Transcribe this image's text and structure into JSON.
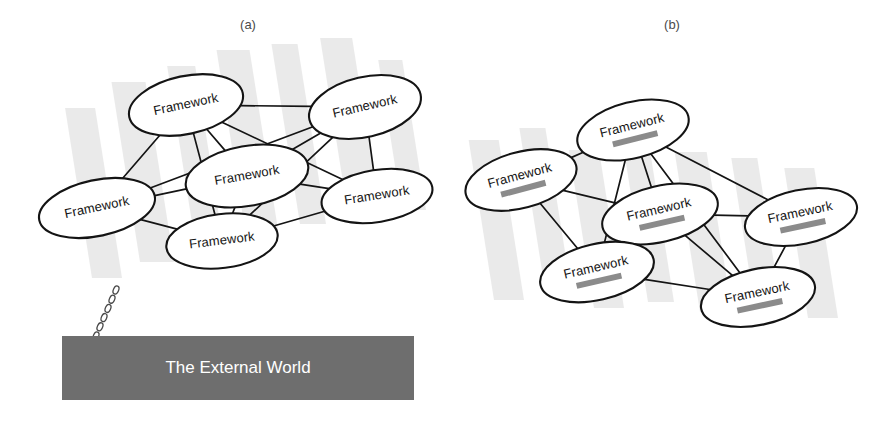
{
  "figure": {
    "width": 890,
    "height": 421,
    "background": "#ffffff",
    "panels": [
      {
        "id": "panel-a",
        "caption": "(a)",
        "caption_x": 248,
        "caption_y": 26,
        "nodes": [
          {
            "id": "a1",
            "label": "Framework",
            "cx": 186,
            "cy": 105,
            "rx": 58,
            "ry": 29,
            "rot": -12,
            "redacted": false
          },
          {
            "id": "a2",
            "label": "Framework",
            "cx": 365,
            "cy": 107,
            "rx": 57,
            "ry": 30,
            "rot": -13,
            "redacted": false
          },
          {
            "id": "a3",
            "label": "Framework",
            "cx": 247,
            "cy": 176,
            "rx": 62,
            "ry": 30,
            "rot": -10,
            "redacted": false
          },
          {
            "id": "a4",
            "label": "Framework",
            "cx": 97,
            "cy": 208,
            "rx": 59,
            "ry": 28,
            "rot": -12,
            "redacted": false
          },
          {
            "id": "a5",
            "label": "Framework",
            "cx": 377,
            "cy": 196,
            "rx": 56,
            "ry": 26,
            "rot": -9,
            "redacted": false
          },
          {
            "id": "a6",
            "label": "Framework",
            "cx": 222,
            "cy": 241,
            "rx": 56,
            "ry": 27,
            "rot": -7,
            "redacted": false
          }
        ],
        "edges": [
          [
            "a1",
            "a2"
          ],
          [
            "a1",
            "a3"
          ],
          [
            "a1",
            "a4"
          ],
          [
            "a1",
            "a5"
          ],
          [
            "a1",
            "a6"
          ],
          [
            "a2",
            "a3"
          ],
          [
            "a2",
            "a4"
          ],
          [
            "a2",
            "a5"
          ],
          [
            "a2",
            "a6"
          ],
          [
            "a3",
            "a4"
          ],
          [
            "a3",
            "a5"
          ],
          [
            "a3",
            "a6"
          ],
          [
            "a4",
            "a6"
          ],
          [
            "a5",
            "a6"
          ]
        ],
        "bands": [
          {
            "x": 92,
            "y": 108,
            "w": 30,
            "h": 170,
            "skew": -9
          },
          {
            "x": 140,
            "y": 82,
            "w": 34,
            "h": 180,
            "skew": -9
          },
          {
            "x": 196,
            "y": 66,
            "w": 28,
            "h": 182,
            "skew": -9
          },
          {
            "x": 246,
            "y": 50,
            "w": 33,
            "h": 186,
            "skew": -9
          },
          {
            "x": 300,
            "y": 44,
            "w": 26,
            "h": 180,
            "skew": -9
          },
          {
            "x": 348,
            "y": 38,
            "w": 32,
            "h": 176,
            "skew": -9
          },
          {
            "x": 402,
            "y": 60,
            "w": 24,
            "h": 150,
            "skew": -9
          }
        ],
        "external_world": {
          "label": "The External World",
          "x": 62,
          "y": 336,
          "w": 352,
          "h": 64,
          "color": "#6e6e6e",
          "text_color": "#ffffff"
        },
        "chain": {
          "from_x": 116,
          "from_y": 290,
          "to_x": 96,
          "to_y": 336,
          "links": 6
        }
      },
      {
        "id": "panel-b",
        "caption": "(b)",
        "caption_x": 672,
        "caption_y": 26,
        "nodes": [
          {
            "id": "b1",
            "label": "Framework",
            "cx": 633,
            "cy": 130,
            "rx": 57,
            "ry": 28,
            "rot": -14,
            "redacted": true
          },
          {
            "id": "b2",
            "label": "Framework",
            "cx": 521,
            "cy": 180,
            "rx": 57,
            "ry": 28,
            "rot": -15,
            "redacted": true
          },
          {
            "id": "b3",
            "label": "Framework",
            "cx": 660,
            "cy": 214,
            "rx": 59,
            "ry": 28,
            "rot": -13,
            "redacted": true
          },
          {
            "id": "b4",
            "label": "Framework",
            "cx": 801,
            "cy": 217,
            "rx": 57,
            "ry": 27,
            "rot": -12,
            "redacted": true
          },
          {
            "id": "b5",
            "label": "Framework",
            "cx": 597,
            "cy": 272,
            "rx": 58,
            "ry": 28,
            "rot": -13,
            "redacted": true
          },
          {
            "id": "b6",
            "label": "Framework",
            "cx": 758,
            "cy": 297,
            "rx": 58,
            "ry": 28,
            "rot": -12,
            "redacted": true
          }
        ],
        "edges": [
          [
            "b1",
            "b2"
          ],
          [
            "b1",
            "b3"
          ],
          [
            "b1",
            "b4"
          ],
          [
            "b1",
            "b5"
          ],
          [
            "b1",
            "b6"
          ],
          [
            "b2",
            "b3"
          ],
          [
            "b2",
            "b5"
          ],
          [
            "b3",
            "b4"
          ],
          [
            "b3",
            "b5"
          ],
          [
            "b3",
            "b6"
          ],
          [
            "b4",
            "b6"
          ],
          [
            "b5",
            "b6"
          ]
        ],
        "bands": [
          {
            "x": 494,
            "y": 140,
            "w": 30,
            "h": 160,
            "skew": -9
          },
          {
            "x": 546,
            "y": 128,
            "w": 26,
            "h": 168,
            "skew": -9
          },
          {
            "x": 594,
            "y": 150,
            "w": 30,
            "h": 158,
            "skew": -9
          },
          {
            "x": 648,
            "y": 140,
            "w": 26,
            "h": 162,
            "skew": -9
          },
          {
            "x": 700,
            "y": 152,
            "w": 32,
            "h": 160,
            "skew": -9
          },
          {
            "x": 756,
            "y": 158,
            "w": 26,
            "h": 156,
            "skew": -9
          },
          {
            "x": 808,
            "y": 168,
            "w": 30,
            "h": 150,
            "skew": -9
          }
        ],
        "redaction": {
          "color": "#8b8b8b",
          "width": 46,
          "height": 6,
          "offset_y": 13
        }
      }
    ]
  },
  "chart_data": {
    "type": "diagram",
    "title": "",
    "panels": [
      {
        "name": "(a)",
        "node_count": 6,
        "node_labels": [
          "Framework",
          "Framework",
          "Framework",
          "Framework",
          "Framework",
          "Framework"
        ],
        "edge_count": 14,
        "anchor": "The External World"
      },
      {
        "name": "(b)",
        "node_count": 6,
        "node_labels": [
          "Framework",
          "Framework",
          "Framework",
          "Framework",
          "Framework",
          "Framework"
        ],
        "edge_count": 12,
        "anchor": null,
        "note": "each node label has a redacted gray bar beneath it"
      }
    ]
  }
}
